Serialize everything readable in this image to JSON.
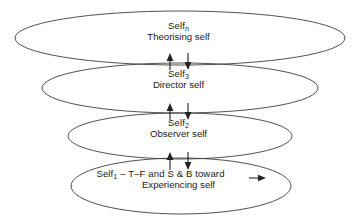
{
  "diagram": {
    "type": "nested-ellipse-hierarchy",
    "background_color": "#ffffff",
    "stroke_color": "#3d3d3d",
    "text_color": "#1a1a1a",
    "levels": [
      {
        "id": "self-n",
        "name_main": "Self",
        "name_subscript": "n",
        "descriptor": "Theorising self",
        "order": 4
      },
      {
        "id": "self-3",
        "name_main": "Self",
        "name_subscript": "3",
        "descriptor": "Director self",
        "order": 3
      },
      {
        "id": "self-2",
        "name_main": "Self",
        "name_subscript": "2",
        "descriptor": "Observer self",
        "order": 2
      },
      {
        "id": "self-1",
        "name_main": "Self",
        "name_subscript": "1",
        "qualifier": " – T–F and S & B toward",
        "descriptor": "Experiencing self",
        "order": 1
      }
    ],
    "connectors": [
      {
        "id": "connector-n-3",
        "kind": "bidirectional-arrow-pair",
        "between": [
          "self-n",
          "self-3"
        ]
      },
      {
        "id": "connector-3-2",
        "kind": "bidirectional-arrow-pair",
        "between": [
          "self-3",
          "self-2"
        ]
      },
      {
        "id": "connector-2-1",
        "kind": "bidirectional-arrow-pair",
        "between": [
          "self-2",
          "self-1"
        ]
      },
      {
        "id": "connector-toward",
        "kind": "right-arrow",
        "within": "self-1"
      }
    ]
  }
}
